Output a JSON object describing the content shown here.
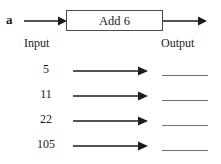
{
  "diagram": {
    "variable_label": "a",
    "machine_label": "Add 6",
    "input_label": "Input",
    "output_label": "Output",
    "rows": [
      {
        "input": "5",
        "output": ""
      },
      {
        "input": "11",
        "output": ""
      },
      {
        "input": "22",
        "output": ""
      },
      {
        "input": "105",
        "output": ""
      }
    ],
    "colors": {
      "box_border": "#4a4a4a",
      "arrow": "#1b1b1b",
      "blank_line": "#6f6f6f",
      "text": "#1b1b1b",
      "background": "#ffffff"
    }
  }
}
